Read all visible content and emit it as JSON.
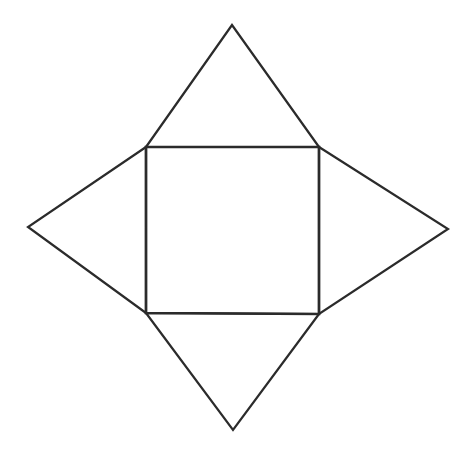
{
  "diagram": {
    "type": "square-pyramid-net",
    "stroke_color": "#2b2b2b",
    "background_color": "#ffffff",
    "stroke_width": 2.2,
    "base_square": {
      "top_left": [
        146,
        147
      ],
      "top_right": [
        319,
        147
      ],
      "bottom_right": [
        319,
        314
      ],
      "bottom_left": [
        146,
        313
      ]
    },
    "triangles": [
      {
        "name": "top-face",
        "points": [
          [
            146,
            147
          ],
          [
            232,
            25
          ],
          [
            319,
            147
          ]
        ]
      },
      {
        "name": "right-face",
        "points": [
          [
            319,
            147
          ],
          [
            448,
            229
          ],
          [
            319,
            314
          ]
        ]
      },
      {
        "name": "bottom-face",
        "points": [
          [
            146,
            313
          ],
          [
            233,
            430
          ],
          [
            319,
            314
          ]
        ]
      },
      {
        "name": "left-face",
        "points": [
          [
            146,
            147
          ],
          [
            28,
            227
          ],
          [
            146,
            313
          ]
        ]
      }
    ]
  }
}
